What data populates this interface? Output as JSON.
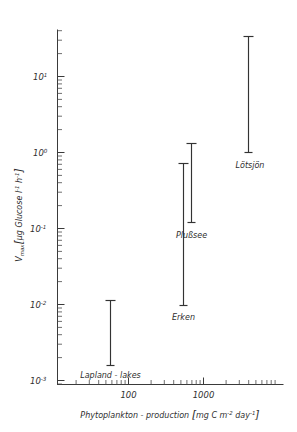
{
  "chart_data": {
    "type": "scatter",
    "title": "",
    "subtitle": "",
    "xlabel": "Phytoplankton - production [mg C m-2 day-1]",
    "ylabel": "Vmax [ug Glucose l-1 h-1]",
    "xscale": "log",
    "yscale": "log",
    "xlim": [
      20,
      9000
    ],
    "ylim": [
      0.0005,
      60
    ],
    "grid": false,
    "legend": "none",
    "x_tick_labels": [
      "100",
      "1000"
    ],
    "x_tick_values": [
      100,
      1000
    ],
    "y_tick_labels": [
      "10-3",
      "10-2",
      "10-1",
      "100",
      "101"
    ],
    "y_tick_values": [
      0.001,
      0.01,
      0.1,
      1,
      10
    ],
    "y_tick_mantissa": [
      "10",
      "10",
      "10",
      "10",
      "10"
    ],
    "y_tick_exponent": [
      "-3",
      "-2",
      "-1",
      "0",
      "1"
    ],
    "series": [
      {
        "name": "Lapland - lakes",
        "x": 60,
        "y_low": 0.001,
        "y_high": 0.0085,
        "label_position": "below"
      },
      {
        "name": "Erken",
        "x": 500,
        "y_low": 0.0072,
        "y_high": 0.62,
        "label_position": "below"
      },
      {
        "name": "Plußsee",
        "x": 620,
        "y_low": 0.098,
        "y_high": 1.25,
        "label_position": "below"
      },
      {
        "name": "Lötsjön",
        "x": 3300,
        "y_low": 0.95,
        "y_high": 32,
        "label_position": "below"
      }
    ]
  },
  "axes": {
    "y_label_text": "V",
    "y_label_sub": "max",
    "y_label_unit_open": "[",
    "y_label_unit": "µg Glucose l",
    "y_label_unit_sup1": "-1",
    "y_label_unit_mid": " h",
    "y_label_unit_sup2": "-1",
    "y_label_unit_close": "]",
    "x_label_main": "Phytoplankton - production ",
    "x_label_unit_open": "[",
    "x_label_unit_a": "mg C m",
    "x_label_unit_sup1": "-2",
    "x_label_unit_b": " day",
    "x_label_unit_sup2": "-1",
    "x_label_unit_close": "]"
  },
  "ticks": {
    "y": [
      {
        "label_base": "10",
        "label_exp": "1"
      },
      {
        "label_base": "10",
        "label_exp": "0"
      },
      {
        "label_base": "10",
        "label_exp": "-1"
      },
      {
        "label_base": "10",
        "label_exp": "-2"
      },
      {
        "label_base": "10",
        "label_exp": "-3"
      }
    ],
    "x": [
      {
        "label": "100"
      },
      {
        "label": "1000"
      }
    ]
  },
  "series_labels": {
    "lapland": "Lapland - lakes",
    "erken": "Erken",
    "plussee": "Plußsee",
    "lotsjon": "Lötsjön"
  },
  "colors": {
    "background": "#ffffff",
    "ink": "#333333",
    "axis": "#3a3a3a"
  }
}
